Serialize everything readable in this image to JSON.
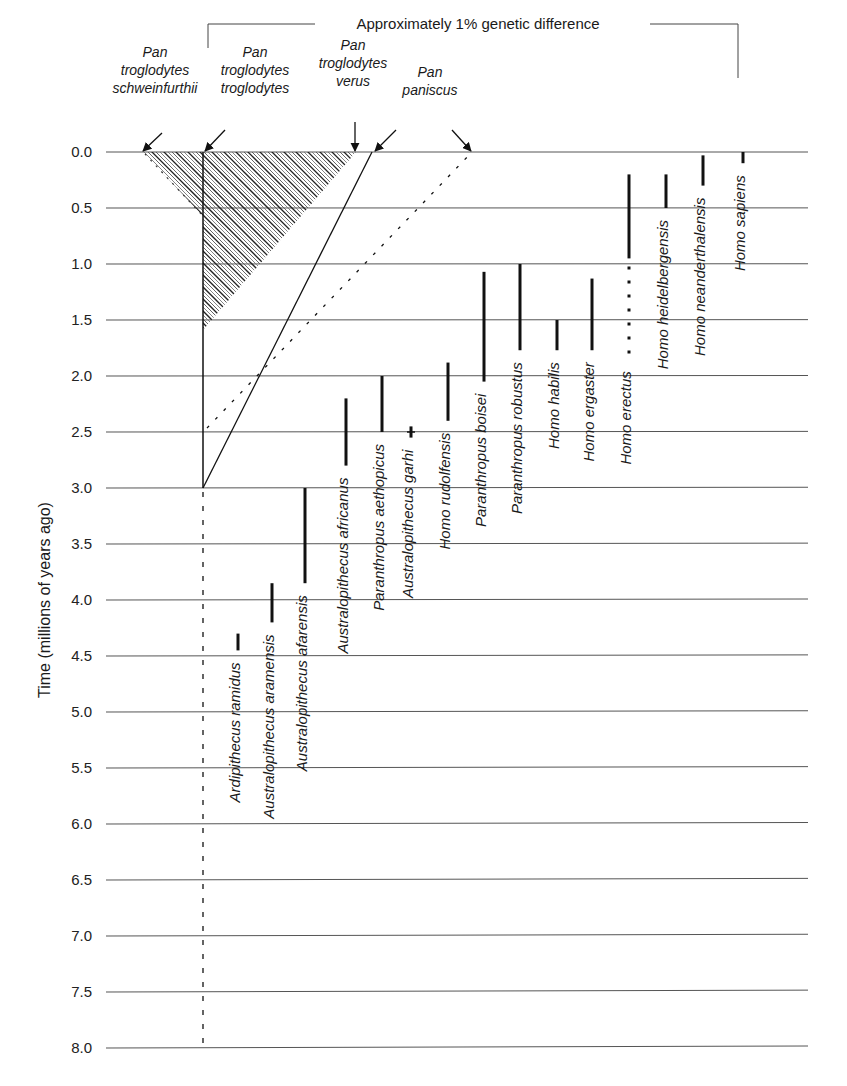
{
  "chart_data": {
    "type": "range-bar / phylogeny timeline",
    "title": "",
    "ylabel": "Time (millions of years ago)",
    "ylim": [
      0,
      8.0
    ],
    "y_inverted": true,
    "y_ticks": [
      "0.0",
      "0.5",
      "1.0",
      "1.5",
      "2.0",
      "2.5",
      "3.0",
      "3.5",
      "4.0",
      "4.5",
      "5.0",
      "5.5",
      "6.0",
      "6.5",
      "7.0",
      "7.5",
      "8.0"
    ],
    "grid": true,
    "bracket_label": "Approximately 1% genetic difference",
    "pan_labels": [
      {
        "name": "Pan troglodytes schweinfurthii",
        "lines": [
          "Pan",
          "troglodytes",
          "schweinfurthii"
        ]
      },
      {
        "name": "Pan troglodytes troglodytes",
        "lines": [
          "Pan",
          "troglodytes",
          "troglodytes"
        ]
      },
      {
        "name": "Pan troglodytes verus",
        "lines": [
          "Pan",
          "troglodytes",
          "verus"
        ]
      },
      {
        "name": "Pan paniscus",
        "lines": [
          "Pan",
          "paniscus"
        ]
      }
    ],
    "pan_lineage": {
      "chimp_bonobo_split_mya": 3.0,
      "split_lower_bound_dotted_to_mya": 8.0,
      "hatched_region": "Pan troglodytes subspecies divergence (0.0 to ~1.6 Mya)"
    },
    "hominin_ranges": [
      {
        "name": "Ardipithecus ramidus",
        "start": 4.45,
        "end": 4.3
      },
      {
        "name": "Australopithecus aramensis",
        "start": 4.2,
        "end": 3.85
      },
      {
        "name": "Australopithecus afarensis",
        "start": 3.85,
        "end": 3.0
      },
      {
        "name": "Australopithecus africanus",
        "start": 2.8,
        "end": 2.2
      },
      {
        "name": "Paranthropus aethopicus",
        "start": 2.5,
        "end": 2.0
      },
      {
        "name": "Australopithecus garhi",
        "start": 2.55,
        "end": 2.45
      },
      {
        "name": "Homo rudolfensis",
        "start": 2.4,
        "end": 1.88
      },
      {
        "name": "Paranthropus boisei",
        "start": 2.05,
        "end": 1.07
      },
      {
        "name": "Paranthropus robustus",
        "start": 1.77,
        "end": 1.0
      },
      {
        "name": "Homo habilis",
        "start": 1.77,
        "end": 1.5
      },
      {
        "name": "Homo ergaster",
        "start": 1.77,
        "end": 1.13
      },
      {
        "name": "Homo erectus",
        "start": 0.95,
        "end": 0.2,
        "dotted_start": 1.85
      },
      {
        "name": "Homo heidelbergensis",
        "start": 0.5,
        "end": 0.2
      },
      {
        "name": "Homo neanderthalensis",
        "start": 0.3,
        "end": 0.03
      },
      {
        "name": "Homo sapiens",
        "start": 0.1,
        "end": 0.0
      }
    ]
  }
}
